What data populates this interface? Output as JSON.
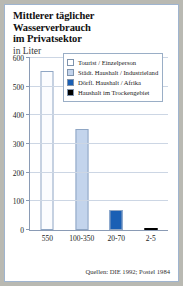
{
  "header": {
    "title_line1": "Mittlerer täglicher Wasserverbrauch",
    "title_line2": "im Privatsektor",
    "subtitle": "in Liter"
  },
  "legend": {
    "items": [
      {
        "label": "Tourist / Einzelperson",
        "color": "#ffffff"
      },
      {
        "label": "Städt. Haushalt / Industrieland",
        "color": "#c3d4ec"
      },
      {
        "label": "Dörfl. Haushalt / Afrika",
        "color": "#1a5fb4"
      },
      {
        "label": "Haushalt im Trockengebiet",
        "color": "#000000"
      }
    ]
  },
  "source": "Quellen: DIE 1992; Postel 1984",
  "chart_data": {
    "type": "bar",
    "title": "Mittlerer täglicher Wasserverbrauch im Privatsektor",
    "subtitle": "in Liter",
    "xlabel": "",
    "ylabel": "",
    "ylim": [
      0,
      600
    ],
    "yticks": [
      0,
      100,
      200,
      300,
      400,
      500,
      600
    ],
    "ytick_labels": [
      "0",
      "100",
      "200",
      "300",
      "400",
      "500",
      "600"
    ],
    "grid": true,
    "legend_position": "top-right",
    "categories": [
      "550",
      "100-350",
      "20-70",
      "2-5"
    ],
    "values": [
      550,
      350,
      70,
      4
    ],
    "series_labels": [
      "Tourist / Einzelperson",
      "Städt. Haushalt / Industrieland",
      "Dörfl. Haushalt / Afrika",
      "Haushalt im Trockengebiet"
    ],
    "colors": [
      "#fbfcfe",
      "#c3d4ec",
      "#1a5fb4",
      "#000000"
    ],
    "source": "Quellen: DIE 1992; Postel 1984"
  }
}
